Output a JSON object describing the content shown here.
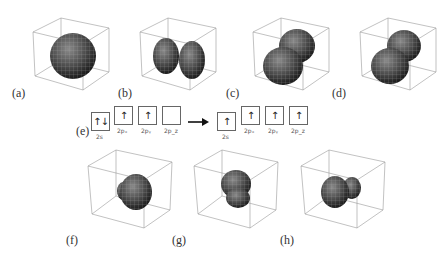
{
  "panels": [
    {
      "id": "a",
      "label": "(a)",
      "shape": "sphere"
    },
    {
      "id": "b",
      "label": "(b)",
      "shape": "two-lobes-horizontal"
    },
    {
      "id": "c",
      "label": "(c)",
      "shape": "two-lobes-depth"
    },
    {
      "id": "d",
      "label": "(d)",
      "shape": "two-lobes-depth"
    },
    {
      "id": "f",
      "label": "(f)",
      "shape": "hybrid-small-back"
    },
    {
      "id": "g",
      "label": "(g)",
      "shape": "hybrid-lower"
    },
    {
      "id": "h",
      "label": "(h)",
      "shape": "hybrid-side"
    }
  ],
  "electron_config": {
    "label": "(e)",
    "before": [
      {
        "orbital": "2s",
        "electrons": "↑↓"
      },
      {
        "orbital": "2pₓ",
        "electrons": "↑"
      },
      {
        "orbital": "2pᵧ",
        "electrons": "↑"
      },
      {
        "orbital": "2p_z",
        "electrons": ""
      }
    ],
    "after": [
      {
        "orbital": "2s",
        "electrons": "↑"
      },
      {
        "orbital": "2pₓ",
        "electrons": "↑"
      },
      {
        "orbital": "2pᵧ",
        "electrons": "↑"
      },
      {
        "orbital": "2p_z",
        "electrons": "↑"
      }
    ],
    "arrow": "→"
  },
  "colors": {
    "surface": "#4a4a4a",
    "grid": "#9a9a9a",
    "box_edge": "#888888"
  }
}
